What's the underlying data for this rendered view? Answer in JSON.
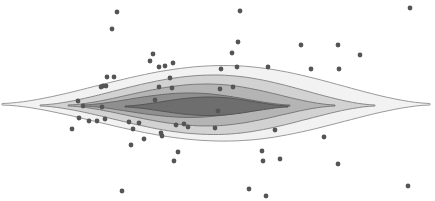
{
  "chart_data": {
    "type": "scatter",
    "subtype": "scatter with filled density contours",
    "title": "",
    "xlabel": "",
    "ylabel": "",
    "axes_visible": false,
    "grid": false,
    "legend": null,
    "contour_levels": [
      {
        "level": 1,
        "fill": "#f2f2f2",
        "stroke": "#9a9a9a",
        "xmin": 2,
        "xmax": 430,
        "center_y": 104,
        "half_height": 38
      },
      {
        "level": 2,
        "fill": "#d2d2d2",
        "stroke": "#8a8a8a",
        "xmin": 40,
        "xmax": 375,
        "center_y": 105,
        "half_height": 30
      },
      {
        "level": 3,
        "fill": "#b4b4b4",
        "stroke": "#7a7a7a",
        "xmin": 68,
        "xmax": 335,
        "center_y": 105,
        "half_height": 21
      },
      {
        "level": 4,
        "fill": "#8f8f8f",
        "stroke": "#6a6a6a",
        "xmin": 82,
        "xmax": 290,
        "center_y": 105,
        "half_height": 12
      },
      {
        "level": 5,
        "fill": "#6e6e6e",
        "stroke": "#555555",
        "xmin": 125,
        "xmax": 288,
        "center_y": 106,
        "half_height": 9
      }
    ],
    "points_color": "#555555",
    "points": [
      [
        117,
        12
      ],
      [
        112,
        29
      ],
      [
        153,
        54
      ],
      [
        150,
        61
      ],
      [
        159,
        67
      ],
      [
        165,
        66
      ],
      [
        173,
        63
      ],
      [
        107,
        77
      ],
      [
        114,
        77
      ],
      [
        103,
        86
      ],
      [
        101,
        87
      ],
      [
        106,
        86
      ],
      [
        170,
        78
      ],
      [
        172,
        88
      ],
      [
        159,
        87
      ],
      [
        240,
        11
      ],
      [
        238,
        42
      ],
      [
        232,
        53
      ],
      [
        221,
        69
      ],
      [
        237,
        67
      ],
      [
        268,
        67
      ],
      [
        301,
        45
      ],
      [
        311,
        69
      ],
      [
        338,
        45
      ],
      [
        339,
        69
      ],
      [
        360,
        55
      ],
      [
        410,
        8
      ],
      [
        220,
        89
      ],
      [
        233,
        87
      ],
      [
        78,
        101
      ],
      [
        83,
        106
      ],
      [
        102,
        107
      ],
      [
        79,
        118
      ],
      [
        89,
        121
      ],
      [
        97,
        121
      ],
      [
        105,
        119
      ],
      [
        72,
        129
      ],
      [
        129,
        122
      ],
      [
        139,
        123
      ],
      [
        133,
        129
      ],
      [
        144,
        139
      ],
      [
        131,
        145
      ],
      [
        161,
        133
      ],
      [
        162,
        136
      ],
      [
        176,
        125
      ],
      [
        184,
        124
      ],
      [
        188,
        127
      ],
      [
        215,
        128
      ],
      [
        178,
        152
      ],
      [
        174,
        161
      ],
      [
        122,
        191
      ],
      [
        275,
        130
      ],
      [
        262,
        151
      ],
      [
        263,
        161
      ],
      [
        280,
        159
      ],
      [
        324,
        137
      ],
      [
        338,
        164
      ],
      [
        408,
        186
      ],
      [
        249,
        189
      ],
      [
        266,
        196
      ],
      [
        155,
        100
      ],
      [
        218,
        111
      ]
    ]
  }
}
